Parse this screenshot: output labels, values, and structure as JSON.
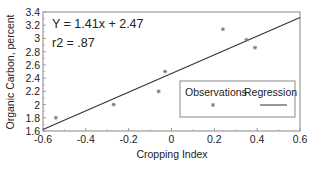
{
  "chart_data": {
    "type": "scatter",
    "title": "",
    "xlabel": "Cropping Index",
    "ylabel": "Organic Carbon, percent",
    "xlim": [
      -0.6,
      0.6
    ],
    "ylim": [
      1.6,
      3.4
    ],
    "x_ticks": [
      -0.6,
      -0.4,
      -0.2,
      0,
      0.2,
      0.4,
      0.6
    ],
    "x_tick_labels": [
      "-0.6",
      "-0.4",
      "-0.2",
      "0",
      "0.2",
      "0.4",
      "0.6"
    ],
    "y_ticks": [
      1.6,
      1.8,
      2.0,
      2.2,
      2.4,
      2.6,
      2.8,
      3.0,
      3.2,
      3.4
    ],
    "y_tick_labels": [
      "1.6",
      "1.8",
      "2",
      "2.2",
      "2.4",
      "2.6",
      "2.8",
      "3",
      "3.2",
      "3.4"
    ],
    "grid": false,
    "legend_position": "lower right",
    "series": [
      {
        "name": "Observations",
        "type": "scatter",
        "marker": "asterisk",
        "points": [
          {
            "x": -0.54,
            "y": 1.8
          },
          {
            "x": -0.27,
            "y": 2.0
          },
          {
            "x": -0.06,
            "y": 2.2
          },
          {
            "x": -0.03,
            "y": 2.5
          },
          {
            "x": 0.24,
            "y": 3.14
          },
          {
            "x": 0.35,
            "y": 2.98
          },
          {
            "x": 0.39,
            "y": 2.86
          }
        ]
      },
      {
        "name": "Regression",
        "type": "line",
        "slope": 1.41,
        "intercept": 2.47,
        "points": [
          {
            "x": -0.6,
            "y": 1.624
          },
          {
            "x": 0.6,
            "y": 3.316
          }
        ]
      }
    ],
    "annotations": [
      "Y = 1.41x + 2.47",
      "r2 = .87"
    ]
  },
  "legend": {
    "observations_label": "Observations",
    "regression_label": "Regression"
  },
  "annotation": {
    "equation": "Y = 1.41x + 2.47",
    "r2": "r2 = .87"
  },
  "colors": {
    "axis": "#9a9a9a",
    "line": "#333333",
    "marker": "#777777"
  }
}
